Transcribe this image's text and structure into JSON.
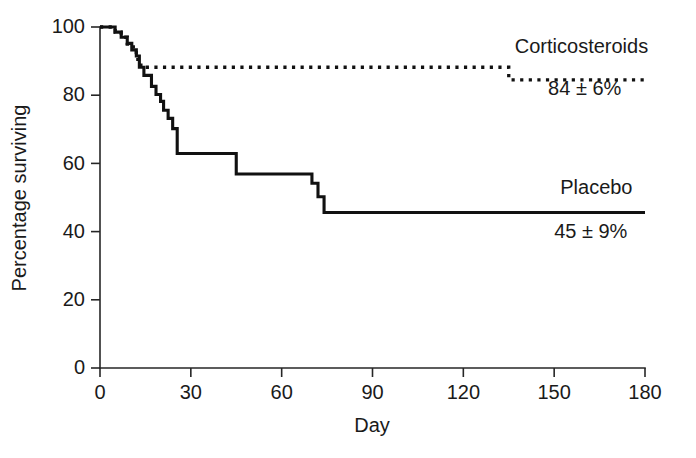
{
  "chart_data": {
    "type": "line",
    "subtype": "kaplan-meier-step",
    "title": "",
    "xlabel": "Day",
    "ylabel": "Percentage surviving",
    "xlim": [
      0,
      180
    ],
    "ylim": [
      0,
      100
    ],
    "xticks": [
      0,
      30,
      60,
      90,
      120,
      150,
      180
    ],
    "xticklabels": [
      "0",
      "30",
      "60",
      "90",
      "120",
      "150",
      "180"
    ],
    "yticks": [
      0,
      20,
      40,
      60,
      80,
      100
    ],
    "yticklabels": [
      "0",
      "20",
      "40",
      "60",
      "80",
      "100"
    ],
    "grid": false,
    "legend_position": "inline-right-annotation",
    "series": [
      {
        "name": "Corticosteroids",
        "style": "dotted",
        "color": "#111111",
        "final_label": "84 ± 6%",
        "final_value": 84,
        "final_error": 6,
        "points": [
          [
            0,
            100
          ],
          [
            5,
            100
          ],
          [
            5,
            98.5
          ],
          [
            7,
            98.5
          ],
          [
            7,
            97
          ],
          [
            9,
            97
          ],
          [
            9,
            95
          ],
          [
            11,
            95
          ],
          [
            11,
            92.5
          ],
          [
            12.5,
            92.5
          ],
          [
            12.5,
            90.5
          ],
          [
            13.5,
            90.5
          ],
          [
            13.5,
            88.2
          ],
          [
            135,
            88.2
          ],
          [
            135,
            84.5
          ],
          [
            180,
            84.5
          ]
        ]
      },
      {
        "name": "Placebo",
        "style": "solid",
        "color": "#111111",
        "final_label": "45 ± 9%",
        "final_value": 45,
        "final_error": 9,
        "points": [
          [
            0,
            100
          ],
          [
            5,
            100
          ],
          [
            5,
            98.5
          ],
          [
            7,
            98.5
          ],
          [
            7,
            97
          ],
          [
            9,
            97
          ],
          [
            9,
            95.2
          ],
          [
            10.5,
            95.2
          ],
          [
            10.5,
            93.3
          ],
          [
            12,
            93.3
          ],
          [
            12,
            91.5
          ],
          [
            13,
            91.5
          ],
          [
            13,
            88.2
          ],
          [
            14.5,
            88.2
          ],
          [
            14.5,
            85.8
          ],
          [
            17,
            85.8
          ],
          [
            17,
            82.6
          ],
          [
            18.5,
            82.6
          ],
          [
            18.5,
            80.2
          ],
          [
            20,
            80.2
          ],
          [
            20,
            78.2
          ],
          [
            21,
            78.2
          ],
          [
            21,
            75.6
          ],
          [
            22.5,
            75.6
          ],
          [
            22.5,
            73.2
          ],
          [
            24,
            73.2
          ],
          [
            24,
            70.2
          ],
          [
            25.5,
            70.2
          ],
          [
            25.5,
            62.9
          ],
          [
            45,
            62.9
          ],
          [
            45,
            56.9
          ],
          [
            70,
            56.9
          ],
          [
            70,
            54.2
          ],
          [
            72,
            54.2
          ],
          [
            72,
            50.2
          ],
          [
            74,
            50.2
          ],
          [
            74,
            45.6
          ],
          [
            180,
            45.6
          ]
        ]
      }
    ],
    "annotations": [
      {
        "id": "corticosteroids-name",
        "text": "Corticosteroids",
        "x": 137,
        "y": 92.5
      },
      {
        "id": "corticosteroids-value",
        "text": "84 ± 6%",
        "x": 148,
        "y": 80
      },
      {
        "id": "placebo-name",
        "text": "Placebo",
        "x": 152,
        "y": 51
      },
      {
        "id": "placebo-value",
        "text": "45 ± 9%",
        "x": 150,
        "y": 38
      }
    ]
  },
  "figure": {
    "background_color": "#ffffff",
    "ink_color": "#111111",
    "axis_color": "#262626"
  },
  "axes": {
    "y_title": "Percentage surviving",
    "x_title": "Day",
    "y_labels": [
      "100",
      "80",
      "60",
      "40",
      "20",
      "0"
    ],
    "x_labels": [
      "0",
      "30",
      "60",
      "90",
      "120",
      "150",
      "180"
    ]
  },
  "labels": {
    "corticosteroids_name": "Corticosteroids",
    "corticosteroids_value": "84 ± 6%",
    "placebo_name": "Placebo",
    "placebo_value": "45 ± 9%"
  }
}
